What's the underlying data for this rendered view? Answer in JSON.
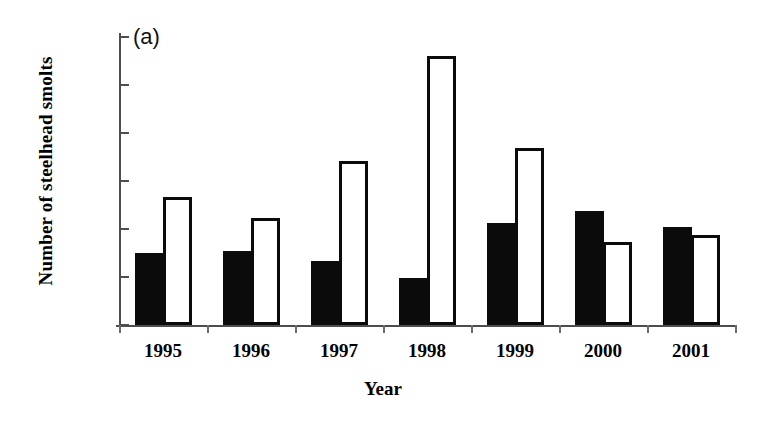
{
  "panel_tag": "(a)",
  "chart_data": {
    "type": "bar",
    "title": "",
    "panel_label": "(a)",
    "xlabel": "Year",
    "ylabel": "Number of steelhead smolts",
    "categories": [
      "1995",
      "1996",
      "1997",
      "1998",
      "1999",
      "2000",
      "2001"
    ],
    "ylim": [
      0,
      6000
    ],
    "yticks": [
      0,
      1000,
      2000,
      3000,
      4000,
      5000,
      6000
    ],
    "ytick_labels": [
      "0",
      "1000",
      "2000",
      "3000",
      "4000",
      "5000",
      "6000"
    ],
    "grid": false,
    "legend": null,
    "series": [
      {
        "name": "filled-black-series",
        "style": "solid-black",
        "color": "#0b0b0b",
        "values": [
          1490,
          1540,
          1340,
          980,
          2130,
          2380,
          2050
        ]
      },
      {
        "name": "open-white-series",
        "style": "open-white-outlined",
        "color": "#ffffff",
        "edge_color": "#0b0b0b",
        "values": [
          2660,
          2220,
          3420,
          5610,
          3680,
          1730,
          1880
        ]
      }
    ]
  }
}
